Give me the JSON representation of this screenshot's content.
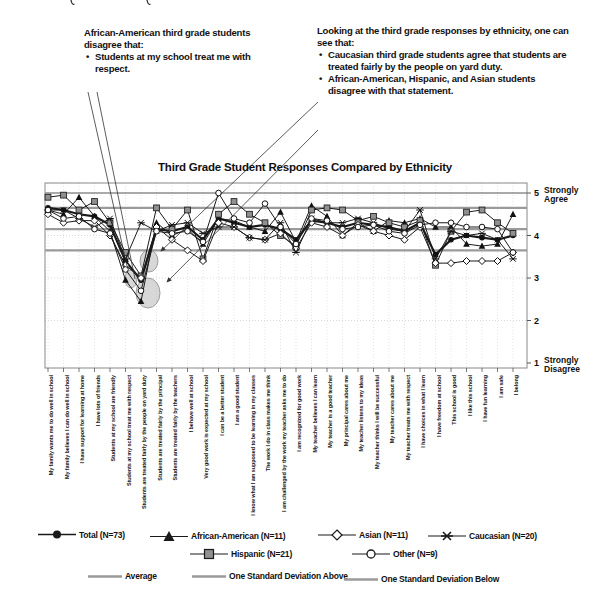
{
  "page": {
    "cropped_text_remnant_visible": true
  },
  "annotations": {
    "left": {
      "heading": "African-American third grade students disagree that:",
      "bullets": [
        "Students at my school treat me with respect."
      ]
    },
    "right": {
      "heading": "Looking at the third grade responses by ethnicity, one can see that:",
      "bullets": [
        "Caucasian third grade students agree that students are treated fairly by the people on yard duty.",
        "African-American, Hispanic, and Asian students disagree with that statement."
      ]
    }
  },
  "legend": {
    "total": "Total (N=73)",
    "african_american": "African-American (N=11)",
    "hispanic": "Hispanic (N=21)",
    "asian": "Asian (N=11)",
    "caucasian": "Caucasian (N=20)",
    "other": "Other (N=9)",
    "average": "Average",
    "sd_above": "One Standard Deviation Above",
    "sd_below": "One Standard Deviation Below"
  },
  "colors": {
    "series_line": "#1a1a1a",
    "hispanic_fill": "#909090",
    "reference_line": "#9a9a9a",
    "highlight_fill": "#b0b0b0",
    "grid": "#d8d8d8"
  },
  "chart_data": {
    "type": "line",
    "title": "Third Grade Student Responses Compared by Ethnicity",
    "y_axis": {
      "min": 1,
      "max": 5,
      "ticks": [
        5,
        4,
        3,
        2,
        1
      ],
      "top_label": "Strongly Agree",
      "bottom_label": "Strongly Disagree"
    },
    "reference_lines": {
      "one_sd_above": 4.65,
      "average": 4.15,
      "one_sd_below": 3.65
    },
    "categories": [
      "My family wants me to do well in school",
      "My family believes I can do well in school",
      "I have support for learning at home",
      "I have lots of friends",
      "Students at my school are friendly",
      "Students at my school treat me with respect",
      "Students are treated fairly by the people on yard duty",
      "Students are treated fairly by the principal",
      "Students are treated fairly by the teachers",
      "I behave well at school",
      "Very good work is expected at my school",
      "I can be a better student",
      "I am a good student",
      "I know what I am supposed to be learning in my classes",
      "The work I do in class makes me think",
      "I am challenged by the work my teacher asks me to do",
      "I am recognized for good work",
      "My teacher believes I can learn",
      "My teacher is a good teacher",
      "My principal cares about me",
      "My teacher listens to my ideas",
      "My teacher thinks I will be successful",
      "My teacher cares about me",
      "My teacher treats me with respect",
      "I have choices in what I learn",
      "I have freedom at school",
      "This school is good",
      "I like this school",
      "I have fun learning",
      "I am safe",
      "I belong"
    ],
    "series": [
      {
        "name": "Total (N=73)",
        "marker": "filled-circle",
        "line_width": 2.2,
        "values": [
          4.65,
          4.6,
          4.5,
          4.45,
          4.25,
          3.4,
          2.95,
          4.15,
          4.1,
          4.2,
          3.9,
          4.4,
          4.3,
          4.2,
          4.25,
          4.15,
          3.9,
          4.35,
          4.3,
          4.2,
          4.3,
          4.25,
          4.2,
          4.1,
          4.3,
          3.55,
          3.9,
          4.0,
          3.95,
          3.9,
          4.0
        ]
      },
      {
        "name": "African-American (N=11)",
        "marker": "filled-triangle",
        "line_width": 1,
        "values": [
          4.6,
          4.5,
          4.9,
          4.45,
          4.1,
          2.95,
          2.45,
          4.3,
          4.0,
          4.15,
          3.8,
          4.4,
          4.35,
          4.2,
          4.1,
          4.55,
          3.85,
          4.7,
          4.45,
          4.0,
          4.3,
          4.1,
          4.35,
          4.3,
          4.4,
          4.2,
          4.2,
          3.8,
          3.75,
          3.8,
          4.5
        ]
      },
      {
        "name": "Hispanic (N=21)",
        "marker": "gray-filled-square",
        "line_width": 1,
        "values": [
          4.9,
          4.95,
          4.6,
          4.8,
          4.3,
          3.6,
          3.05,
          4.65,
          4.15,
          4.6,
          3.45,
          4.5,
          4.8,
          4.5,
          4.3,
          4.0,
          3.75,
          4.6,
          4.65,
          4.6,
          4.35,
          4.45,
          4.3,
          4.2,
          4.35,
          3.3,
          4.1,
          4.55,
          4.6,
          4.3,
          4.05
        ]
      },
      {
        "name": "Asian (N=11)",
        "marker": "open-diamond",
        "line_width": 1,
        "values": [
          4.5,
          4.3,
          4.35,
          4.35,
          4.0,
          3.3,
          3.0,
          4.2,
          3.9,
          3.65,
          3.4,
          4.3,
          4.2,
          3.95,
          3.9,
          4.05,
          3.7,
          4.3,
          4.2,
          4.0,
          4.25,
          4.1,
          4.0,
          3.9,
          4.2,
          3.35,
          3.35,
          3.4,
          3.4,
          3.4,
          3.6
        ]
      },
      {
        "name": "Caucasian (N=20)",
        "marker": "asterisk",
        "line_width": 1,
        "values": [
          4.6,
          4.6,
          4.4,
          4.2,
          4.4,
          3.45,
          4.3,
          4.1,
          4.25,
          4.3,
          4.05,
          4.2,
          4.2,
          3.95,
          3.9,
          4.3,
          3.6,
          4.4,
          4.3,
          4.3,
          4.4,
          4.3,
          4.15,
          4.1,
          4.6,
          3.45,
          4.1,
          4.0,
          4.05,
          3.9,
          3.45
        ]
      },
      {
        "name": "Other (N=9)",
        "marker": "open-circle",
        "line_width": 1,
        "values": [
          4.6,
          4.4,
          4.45,
          4.15,
          4.05,
          3.2,
          2.7,
          4.1,
          4.05,
          4.1,
          3.85,
          5.0,
          4.4,
          4.3,
          4.75,
          4.2,
          3.8,
          4.4,
          4.35,
          4.15,
          4.2,
          4.25,
          4.1,
          4.05,
          4.25,
          4.3,
          4.3,
          4.2,
          4.2,
          4.15,
          3.6
        ]
      }
    ],
    "legend_position": "bottom",
    "grid": true
  }
}
